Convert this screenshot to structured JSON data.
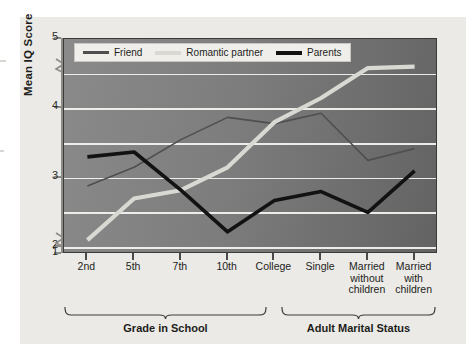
{
  "figure": {
    "background_color": "#ebeae6",
    "plot_background_color": "#7b7b7b",
    "gridline_color": "#f2f2ee"
  },
  "legend": {
    "position": "top-left-inside",
    "items": [
      {
        "label": "Friend",
        "color": "#4f4f4f",
        "weight": "thin"
      },
      {
        "label": "Romantic partner",
        "color": "#d9d9d4",
        "weight": "thick"
      },
      {
        "label": "Parents",
        "color": "#121212",
        "weight": "thick"
      }
    ]
  },
  "axes": {
    "y_title": "Mean IQ Score",
    "y_ticks": [
      "5",
      "4",
      "3",
      "2",
      "1"
    ],
    "y_tick_values": [
      5,
      4,
      3,
      2,
      1
    ],
    "y_break_between": [
      1,
      2
    ],
    "gridline_values": [
      4.5,
      4,
      3.5,
      3,
      2.5,
      2
    ],
    "x_ticks": [
      "2nd",
      "5th",
      "7th",
      "10th",
      "College",
      "Single",
      "Married\nwithout\nchildren",
      "Married\nwith\nchildren"
    ]
  },
  "groups": [
    {
      "label": "Grade in School",
      "from_index": 0,
      "to_index": 4
    },
    {
      "label": "Adult Marital Status",
      "from_index": 5,
      "to_index": 7
    }
  ],
  "chart_data": {
    "type": "line",
    "title": "",
    "subtitle": "",
    "xlabel": "",
    "ylabel": "Mean IQ Score",
    "ylim": [
      1,
      5
    ],
    "ybreak": [
      1,
      2
    ],
    "grid": true,
    "legend_position": "upper left (inside plot)",
    "categories": [
      "2nd",
      "5th",
      "7th",
      "10th",
      "College",
      "Single",
      "Married without children",
      "Married with children"
    ],
    "category_groups": [
      "Grade in School",
      "Grade in School",
      "Grade in School",
      "Grade in School",
      "Grade in School",
      "Adult Marital Status",
      "Adult Marital Status",
      "Adult Marital Status"
    ],
    "series": [
      {
        "name": "Friend",
        "color": "#4f4f4f",
        "line_width": 1.6,
        "values": [
          2.88,
          3.15,
          3.55,
          3.87,
          3.78,
          3.93,
          3.25,
          3.42
        ]
      },
      {
        "name": "Romantic partner",
        "color": "#d9d9d4",
        "line_width": 4.2,
        "values": [
          2.1,
          2.7,
          2.82,
          3.15,
          3.8,
          4.15,
          4.58,
          4.6
        ]
      },
      {
        "name": "Parents",
        "color": "#121212",
        "line_width": 3.6,
        "values": [
          3.3,
          3.37,
          2.82,
          2.22,
          2.67,
          2.8,
          2.5,
          3.1
        ]
      }
    ]
  }
}
